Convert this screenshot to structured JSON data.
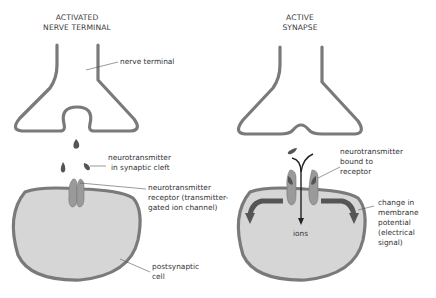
{
  "panels": [
    {
      "title_line1": "ACTIVATED",
      "title_line2": "NERVE TERMINAL",
      "labels": {
        "nerve_terminal": "nerve terminal",
        "nt_cleft_1": "neurotransmitter",
        "nt_cleft_2": "in synaptic cleft",
        "receptor_1": "neurotransmitter",
        "receptor_2": "receptor (transmitter-",
        "receptor_3": "gated ion channel)",
        "cell_1": "postsynaptic",
        "cell_2": "cell"
      }
    },
    {
      "title_line1": "ACTIVE",
      "title_line2": "SYNAPSE",
      "labels": {
        "bound_1": "neurotransmitter",
        "bound_2": "bound to",
        "bound_3": "receptor",
        "ions": "ions",
        "change_1": "change in",
        "change_2": "membrane",
        "change_3": "potential",
        "change_4": "(electrical",
        "change_5": "signal)"
      }
    }
  ],
  "colors": {
    "membrane": "#7a7a7a",
    "cell_fill": "#d6d6d6",
    "receptor": "#9a9a9a",
    "transmitter": "#555555",
    "arrow": "#555555",
    "text": "#333333"
  }
}
